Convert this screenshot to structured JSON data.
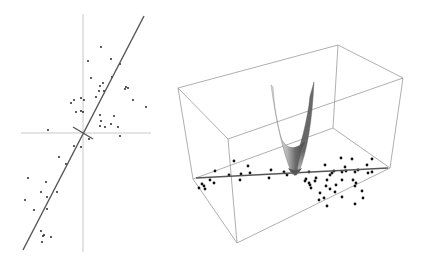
{
  "figure": {
    "colors": {
      "axis": "#c8c8c8",
      "fit_line": "#555555",
      "point": "#111111",
      "box_edge": "#9a9a9a",
      "surface_light": "#d8d8d8",
      "surface_dark": "#5a5a5a"
    }
  },
  "left_plot": {
    "type": "scatter",
    "axes": {
      "vertical": {
        "x": 83,
        "y1": 14,
        "y2": 252
      },
      "horizontal": {
        "y": 133,
        "x1": 21,
        "x2": 151
      }
    },
    "fit_line": {
      "x1": 23,
      "y1": 250,
      "x2": 144,
      "y2": 16
    },
    "perpendicular_line": {
      "x1": 73,
      "y1": 127,
      "x2": 93,
      "y2": 139
    },
    "points": [
      [
        101,
        47
      ],
      [
        88,
        61
      ],
      [
        111,
        59
      ],
      [
        120,
        64
      ],
      [
        91,
        78
      ],
      [
        112,
        77
      ],
      [
        103,
        83
      ],
      [
        100,
        86
      ],
      [
        126,
        87
      ],
      [
        128,
        88
      ],
      [
        125,
        89
      ],
      [
        99,
        91
      ],
      [
        104,
        91
      ],
      [
        96,
        97
      ],
      [
        81,
        98
      ],
      [
        74,
        100
      ],
      [
        84,
        100
      ],
      [
        71,
        103
      ],
      [
        133,
        100
      ],
      [
        146,
        107
      ],
      [
        81,
        111
      ],
      [
        76,
        112
      ],
      [
        83,
        112
      ],
      [
        100,
        115
      ],
      [
        114,
        116
      ],
      [
        101,
        121
      ],
      [
        111,
        124
      ],
      [
        100,
        126
      ],
      [
        105,
        127
      ],
      [
        118,
        127
      ],
      [
        48,
        130
      ],
      [
        120,
        136
      ],
      [
        89,
        139
      ],
      [
        74,
        146
      ],
      [
        81,
        147
      ],
      [
        59,
        157
      ],
      [
        66,
        164
      ],
      [
        28,
        178
      ],
      [
        46,
        182
      ],
      [
        41,
        192
      ],
      [
        57,
        192
      ],
      [
        47,
        197
      ],
      [
        25,
        200
      ],
      [
        34,
        210
      ],
      [
        47,
        209
      ],
      [
        41,
        231
      ],
      [
        44,
        235
      ],
      [
        43,
        236
      ],
      [
        51,
        237
      ],
      [
        42,
        242
      ]
    ]
  },
  "right_plot": {
    "type": "3d-scatter",
    "box_vertices": {
      "top_left": [
        8,
        88
      ],
      "top_back": [
        168,
        45
      ],
      "top_right": [
        233,
        78
      ],
      "top_front": [
        58,
        139
      ],
      "bottom_left": [
        23,
        179
      ],
      "bottom_back": [
        163,
        128
      ],
      "bottom_right": [
        220,
        168
      ],
      "bottom_front": [
        67,
        243
      ]
    },
    "fit_line": {
      "x1": 26,
      "y1": 178,
      "x2": 218,
      "y2": 168
    },
    "points": [
      [
        64,
        161
      ],
      [
        78,
        166
      ],
      [
        45,
        171
      ],
      [
        80,
        173
      ],
      [
        71,
        174
      ],
      [
        101,
        170
      ],
      [
        70,
        180
      ],
      [
        59,
        175
      ],
      [
        40,
        180
      ],
      [
        44,
        183
      ],
      [
        32,
        184
      ],
      [
        34,
        186
      ],
      [
        35,
        189
      ],
      [
        29,
        188
      ],
      [
        99,
        178
      ],
      [
        114,
        172
      ],
      [
        117,
        175
      ],
      [
        125,
        174
      ],
      [
        139,
        172
      ],
      [
        146,
        178
      ],
      [
        155,
        165
      ],
      [
        171,
        158
      ],
      [
        182,
        159
      ],
      [
        175,
        167
      ],
      [
        176,
        171
      ],
      [
        185,
        172
      ],
      [
        183,
        180
      ],
      [
        202,
        159
      ],
      [
        197,
        165
      ],
      [
        188,
        170
      ],
      [
        198,
        173
      ],
      [
        202,
        172
      ],
      [
        164,
        171
      ],
      [
        172,
        172
      ],
      [
        160,
        175
      ],
      [
        135,
        181
      ],
      [
        136,
        179
      ],
      [
        139,
        183
      ],
      [
        140,
        185
      ],
      [
        157,
        180
      ],
      [
        156,
        186
      ],
      [
        160,
        189
      ],
      [
        165,
        192
      ],
      [
        166,
        185
      ],
      [
        172,
        180
      ],
      [
        150,
        193
      ],
      [
        185,
        186
      ],
      [
        186,
        183
      ],
      [
        172,
        197
      ],
      [
        192,
        191
      ],
      [
        193,
        198
      ],
      [
        185,
        204
      ],
      [
        141,
        188
      ],
      [
        149,
        200
      ],
      [
        154,
        198
      ],
      [
        157,
        206
      ],
      [
        145,
        181
      ],
      [
        162,
        173
      ]
    ],
    "surface": {
      "shape": "v-parabolic-sheet",
      "left_tip": [
        101,
        85
      ],
      "right_tip": [
        144,
        82
      ],
      "bottom": [
        125,
        175
      ]
    }
  }
}
